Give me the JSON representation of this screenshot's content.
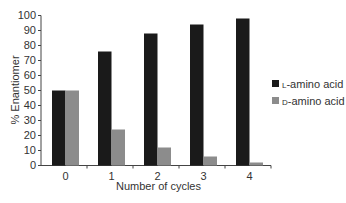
{
  "chart_data": {
    "type": "bar",
    "title": "",
    "xlabel": "Number of cycles",
    "ylabel": "% Enantiomer",
    "categories": [
      "0",
      "1",
      "2",
      "3",
      "4"
    ],
    "series": [
      {
        "name": "L-amino acid",
        "prefix": "l",
        "suffix": "-amino acid",
        "color": "#1a1a1a",
        "values": [
          50,
          76,
          88,
          94,
          98
        ]
      },
      {
        "name": "D-amino acid",
        "prefix": "d",
        "suffix": "-amino acid",
        "color": "#8c8c8c",
        "values": [
          50,
          24,
          12,
          6,
          2
        ]
      }
    ],
    "ylim": [
      0,
      100
    ],
    "yticks": [
      0,
      10,
      20,
      30,
      40,
      50,
      60,
      70,
      80,
      90,
      100
    ],
    "grid": false,
    "legend_position": "right"
  }
}
